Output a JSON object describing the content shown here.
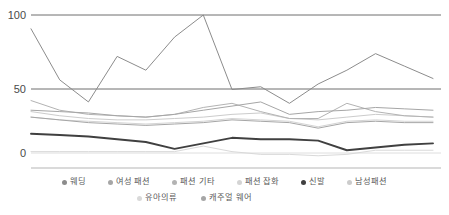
{
  "chart_data": {
    "type": "line",
    "title": "",
    "xlabel": "",
    "ylabel": "",
    "ylim": [
      0,
      100
    ],
    "yticks": [
      0,
      50,
      100
    ],
    "ytick_labels": [
      "0",
      "50",
      "100"
    ],
    "grid": "horizontal",
    "legend_position": "bottom",
    "x": [
      1,
      2,
      3,
      4,
      5,
      6,
      7,
      8,
      9,
      10,
      11,
      12,
      13,
      14,
      15
    ],
    "series": [
      {
        "name": "웨딩",
        "color": "#8c8c8c",
        "values": [
          90,
          53,
          37,
          70,
          60,
          84,
          100,
          46,
          48,
          36,
          50,
          60,
          72,
          63,
          54
        ]
      },
      {
        "name": "여성 패션",
        "color": "#a6a6a6",
        "values": [
          31,
          30,
          29,
          27,
          26,
          28,
          31,
          34,
          37,
          28,
          30,
          31,
          33,
          32,
          31
        ]
      },
      {
        "name": "패션 기타",
        "color": "#b3b3b3",
        "values": [
          38,
          31,
          28,
          27,
          26,
          28,
          33,
          36,
          30,
          25,
          25,
          36,
          30,
          27,
          26
        ]
      },
      {
        "name": "패션 잡화",
        "color": "#d4d4d4",
        "values": [
          26,
          24,
          23,
          22,
          21,
          22,
          23,
          25,
          24,
          23,
          19,
          23,
          24,
          23,
          23
        ]
      },
      {
        "name": "신발",
        "color": "#404040",
        "values": [
          14,
          13,
          12,
          10,
          8,
          3,
          7,
          11,
          10,
          10,
          9,
          2,
          4,
          6,
          7
        ]
      },
      {
        "name": "남성패션",
        "color": "#cccccc",
        "values": [
          30,
          27,
          25,
          24,
          24,
          25,
          26,
          28,
          29,
          25,
          24,
          26,
          28,
          27,
          26
        ]
      },
      {
        "name": "유아의류",
        "color": "#d9d9d9",
        "values": [
          1,
          1,
          1,
          1,
          1,
          1,
          5,
          1,
          -1,
          -1,
          -2,
          -1,
          2,
          2,
          2
        ]
      },
      {
        "name": "캐주얼 웨어",
        "color": "#a6a6a6",
        "values": [
          26,
          24,
          22,
          21,
          20,
          21,
          22,
          24,
          23,
          22,
          18,
          22,
          23,
          22,
          22
        ]
      }
    ],
    "legend_rows": [
      [
        "웨딩",
        "여성 패션",
        "패션 기타",
        "패션 잡화",
        "신발",
        "남성패션"
      ],
      [
        "유아의류",
        "캐주얼 웨어"
      ]
    ]
  }
}
